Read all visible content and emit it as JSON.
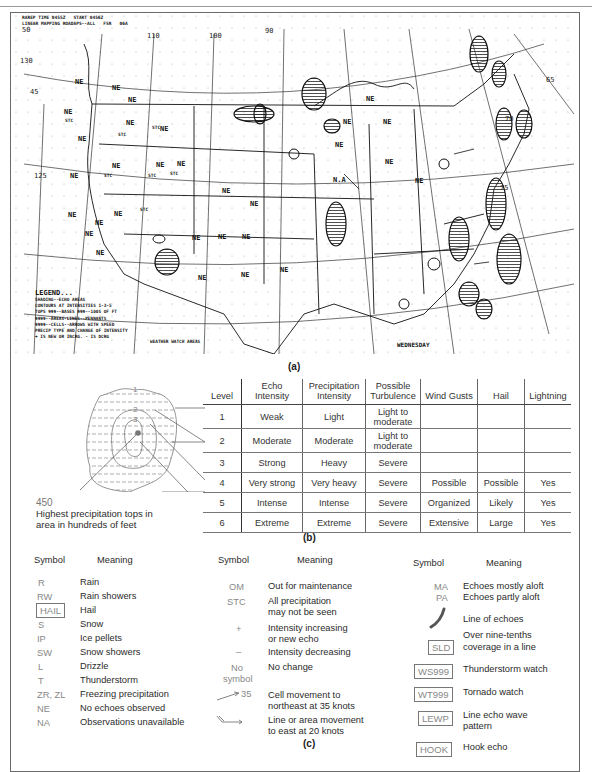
{
  "figure": {
    "panel_a": {
      "caption": "(a)",
      "header_lines": [
        "RAREP TIME 0455Z   START 0456Z",
        "LINEAR MAPPING ROADAPS--ALL   FSR   06A"
      ],
      "lat_labels": [
        "50",
        "130",
        "45",
        "125",
        "40",
        "120",
        "35",
        "30",
        "25"
      ],
      "lon_labels": [
        "110",
        "100",
        "90",
        "65",
        "70",
        "75",
        "30",
        "25"
      ],
      "region_labels": [
        "NE",
        "NE",
        "NE",
        "NE",
        "NE",
        "NE",
        "NE",
        "NE",
        "NE",
        "NE",
        "NE",
        "NE",
        "NE",
        "NE",
        "NE",
        "NE",
        "NE",
        "NE",
        "NE",
        "NE",
        "NE",
        "NE",
        "NE",
        "NE",
        "NE",
        "NE",
        "NE",
        "NE",
        "NE",
        "NE",
        "N.A"
      ],
      "stc_label": "STC",
      "echo_tops": [
        "320",
        "330",
        "250",
        "170",
        "180",
        "230",
        "240",
        "210",
        "270",
        "340",
        "350",
        "220",
        "90",
        "150",
        "190"
      ],
      "legend": {
        "title": "LEGEND...",
        "lines": [
          "SHADING--ECHO AREAS",
          "CONTOURS AT INTENSITIES 1-3-5",
          "TOPS 999--BASES 999--100S OF FT",
          "9999--AREAS-LINES--PENNANTS",
          "9999--CELLS--ARROWS WITH SPEED",
          "PRECIP TYPE AND CHANGE OF INTENSITY",
          "+ IS NEW OR INCRG. - IS DCRG"
        ],
        "bottom_samples": [
          "1.20L",
          "20"
        ]
      },
      "watch_label": "WEATHER WATCH AREAS",
      "day_label": "WEDNESDAY"
    },
    "panel_b": {
      "caption": "(b)",
      "contour_labels": [
        "1",
        "2",
        "3"
      ],
      "tops_value": "450",
      "tops_note": [
        "Highest precipitation tops in",
        "area in hundreds of feet"
      ],
      "table": {
        "headers": [
          "Level",
          "Echo Intensity",
          "Precipitation Intensity",
          "Possible Turbulence",
          "Wind Gusts",
          "Hail",
          "Lightning"
        ],
        "rows": [
          [
            "1",
            "Weak",
            "Light",
            "Light to moderate",
            "",
            "",
            ""
          ],
          [
            "2",
            "Moderate",
            "Moderate",
            "Light to moderate",
            "",
            "",
            ""
          ],
          [
            "3",
            "Strong",
            "Heavy",
            "Severe",
            "",
            "",
            ""
          ],
          [
            "4",
            "Very strong",
            "Very heavy",
            "Severe",
            "Possible",
            "Possible",
            "Yes"
          ],
          [
            "5",
            "Intense",
            "Intense",
            "Severe",
            "Organized",
            "Likely",
            "Yes"
          ],
          [
            "6",
            "Extreme",
            "Extreme",
            "Severe",
            "Extensive",
            "Large",
            "Yes"
          ]
        ]
      }
    },
    "panel_c": {
      "caption": "(c)",
      "symbol_header": "Symbol",
      "meaning_header": "Meaning",
      "col1": [
        {
          "symbol": "R",
          "meaning": "Rain"
        },
        {
          "symbol": "RW",
          "meaning": "Rain showers"
        },
        {
          "symbol": "HAIL",
          "meaning": "Hail",
          "boxed": true
        },
        {
          "symbol": "S",
          "meaning": "Snow"
        },
        {
          "symbol": "IP",
          "meaning": "Ice pellets"
        },
        {
          "symbol": "SW",
          "meaning": "Snow showers"
        },
        {
          "symbol": "L",
          "meaning": "Drizzle"
        },
        {
          "symbol": "T",
          "meaning": "Thunderstorm"
        },
        {
          "symbol": "ZR, ZL",
          "meaning": "Freezing precipitation"
        },
        {
          "symbol": "NE",
          "meaning": "No echoes observed"
        },
        {
          "symbol": "NA",
          "meaning": "Observations unavailable"
        }
      ],
      "col2": [
        {
          "symbol": "OM",
          "meaning": "Out for maintenance"
        },
        {
          "symbol": "STC",
          "meaning": "All precipitation",
          "meaning2": "may not be seen"
        },
        {
          "symbol": "+",
          "meaning": "Intensity increasing",
          "meaning2": "or new echo"
        },
        {
          "symbol": "–",
          "meaning": "Intensity decreasing"
        },
        {
          "symbol": "No",
          "symbol2": "symbol",
          "meaning": "No change"
        },
        {
          "symbol": "35",
          "meaning": "Cell movement to",
          "meaning2": "northeast at 35 knots"
        },
        {
          "symbol": "",
          "meaning": "Line or area movement",
          "meaning2": "to east at 20 knots"
        }
      ],
      "col3": [
        {
          "symbol": "MA",
          "meaning": "Echoes mostly aloft"
        },
        {
          "symbol": "PA",
          "meaning": "Echoes partly aloft"
        },
        {
          "symbol": "",
          "meaning": "Line of echoes"
        },
        {
          "symbol": "SLD",
          "meaning": "Over nine-tenths",
          "meaning2": "coverage in a line",
          "boxed": true
        },
        {
          "symbol": "WS999",
          "meaning": "Thunderstorm watch",
          "boxed": true
        },
        {
          "symbol": "WT999",
          "meaning": "Tornado watch",
          "boxed": true
        },
        {
          "symbol": "LEWP",
          "meaning": "Line echo wave",
          "meaning2": "pattern",
          "boxed": true
        },
        {
          "symbol": "HOOK",
          "meaning": "Hook echo",
          "boxed": true
        }
      ]
    }
  }
}
